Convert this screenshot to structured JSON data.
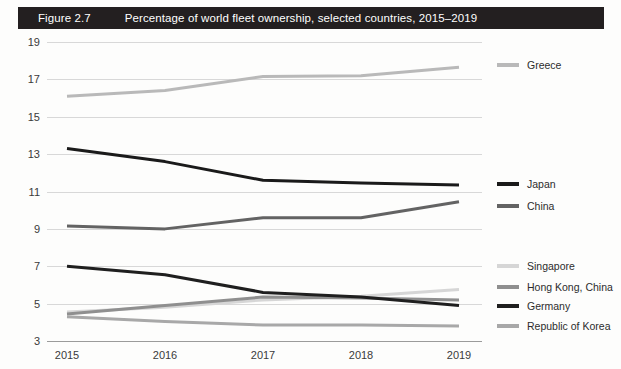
{
  "header": {
    "figure_number": "Figure 2.7",
    "title": "Percentage of world fleet ownership, selected countries, 2015–2019",
    "bar_color": "#231f20",
    "text_color": "#ffffff"
  },
  "chart_data": {
    "type": "line",
    "title": "Percentage of world fleet ownership, selected countries, 2015–2019",
    "xlabel": "",
    "ylabel": "",
    "x": [
      "2015",
      "2016",
      "2017",
      "2018",
      "2019"
    ],
    "categories": [
      "2015",
      "2016",
      "2017",
      "2018",
      "2019"
    ],
    "ylim": [
      3,
      19
    ],
    "yticks": [
      19,
      17,
      15,
      13,
      11,
      9,
      7,
      5,
      3
    ],
    "ytick_labels": [
      "19",
      "17",
      "15",
      "13",
      "11",
      "9",
      "7",
      "5",
      "3"
    ],
    "grid": true,
    "legend_position": "right",
    "series": [
      {
        "name": "Greece",
        "values": [
          16.1,
          16.4,
          17.15,
          17.2,
          17.65
        ],
        "color": "#b9b9b9"
      },
      {
        "name": "Japan",
        "values": [
          13.3,
          12.6,
          11.6,
          11.45,
          11.35
        ],
        "color": "#1a1a1a"
      },
      {
        "name": "China",
        "values": [
          9.15,
          9.0,
          9.6,
          9.6,
          10.45
        ],
        "color": "#636363"
      },
      {
        "name": "Singapore",
        "values": [
          4.55,
          4.8,
          5.2,
          5.4,
          5.75
        ],
        "color": "#d6d6d6"
      },
      {
        "name": "Hong Kong, China",
        "values": [
          4.45,
          4.9,
          5.35,
          5.3,
          5.2
        ],
        "color": "#8f8f8f"
      },
      {
        "name": "Germany",
        "values": [
          7.0,
          6.55,
          5.6,
          5.35,
          4.9
        ],
        "color": "#1f1f1f"
      },
      {
        "name": "Republic of Korea",
        "values": [
          4.3,
          4.05,
          3.85,
          3.85,
          3.8
        ],
        "color": "#a8a8a8"
      }
    ]
  },
  "legend": {
    "groups": [
      {
        "items": [
          {
            "label": "Greece",
            "color": "#b9b9b9",
            "y": 65
          }
        ]
      },
      {
        "items": [
          {
            "label": "Japan",
            "color": "#1a1a1a",
            "y": 184
          },
          {
            "label": "China",
            "color": "#636363",
            "y": 206
          }
        ]
      },
      {
        "items": [
          {
            "label": "Singapore",
            "color": "#d6d6d6",
            "y": 266
          },
          {
            "label": "Hong Kong, China",
            "color": "#8f8f8f",
            "y": 287
          },
          {
            "label": "Germany",
            "color": "#1f1f1f",
            "y": 306
          },
          {
            "label": "Republic of Korea",
            "color": "#a8a8a8",
            "y": 326
          }
        ]
      }
    ]
  },
  "axes": {
    "grid_color": "#d8d8d8",
    "axis_color": "#9b9b9b",
    "tick_text_color": "#3a3a3a"
  }
}
